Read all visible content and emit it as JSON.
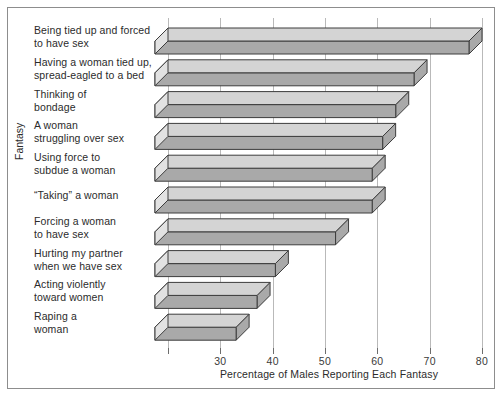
{
  "chart_data": {
    "type": "bar",
    "orientation": "horizontal",
    "title": "",
    "subtitle": "",
    "xlabel": "Percentage of Males Reporting Each Fantasy",
    "ylabel": "Fantasy",
    "xlim": [
      20,
      80
    ],
    "xticks": [
      30,
      40,
      50,
      60,
      70,
      80
    ],
    "xtick_labels": [
      "30",
      "40",
      "50",
      "60",
      "70",
      "80"
    ],
    "grid": true,
    "legend": false,
    "style": "3d-bevelled-horizontal-bars",
    "categories": [
      "Being tied up and forced to have sex",
      "Having a woman tied up, spread-eagled to a bed",
      "Thinking of bondage",
      "A woman struggling over sex",
      "Using force to subdue a woman",
      "“Taking” a woman",
      "Forcing a woman to have sex",
      "Hurting my partner when we have sex",
      "Acting violently toward women",
      "Raping a woman"
    ],
    "values": [
      80.0,
      69.5,
      66.0,
      63.5,
      61.5,
      61.5,
      54.5,
      43.0,
      39.5,
      35.5
    ],
    "colors": {
      "bar_top_face": "#d4d4d4",
      "bar_front_face": "#a9a9a9",
      "bar_side_face": "#e2e2e2",
      "bar_outline": "#3c3c3c",
      "gridline": "#b9b9b9",
      "frame": "#8d8d8d",
      "text": "#2b2b2b",
      "background": "#ffffff"
    }
  },
  "labels": {
    "rows": [
      {
        "line1": "Being tied up and forced",
        "line2": "to have sex"
      },
      {
        "line1": "Having a woman tied up,",
        "line2": "spread-eagled to a bed"
      },
      {
        "line1": "Thinking of",
        "line2": "bondage"
      },
      {
        "line1": "A woman",
        "line2": "struggling over sex"
      },
      {
        "line1": "Using force to",
        "line2": "subdue a woman"
      },
      {
        "line1": "“Taking” a woman",
        "line2": ""
      },
      {
        "line1": "Forcing a woman",
        "line2": "to have sex"
      },
      {
        "line1": "Hurting my partner",
        "line2": "when we have sex"
      },
      {
        "line1": "Acting violently",
        "line2": "toward women"
      },
      {
        "line1": "Raping a",
        "line2": "woman"
      }
    ]
  },
  "axes": {
    "x_title": "Percentage of Males Reporting Each Fantasy",
    "y_title": "Fantasy",
    "x_tick_labels": [
      "30",
      "40",
      "50",
      "60",
      "70",
      "80"
    ]
  }
}
